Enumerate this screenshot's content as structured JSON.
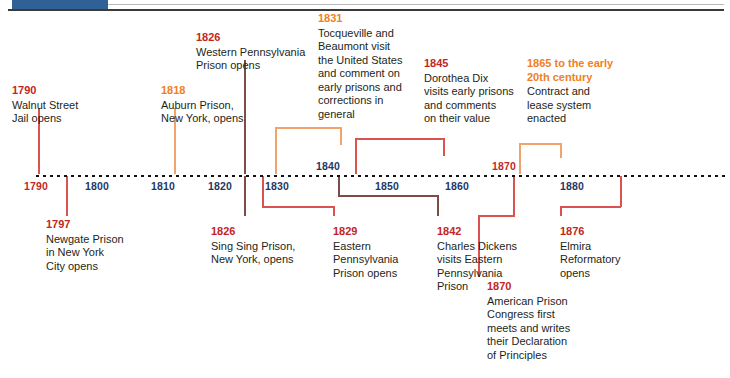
{
  "header": {
    "accent_color": "#2f6096",
    "rule_color": "#3a3a3a"
  },
  "axis": {
    "tick_labels_below": [
      {
        "year": "1790",
        "color": "red"
      },
      {
        "year": "1800",
        "color": "blue"
      },
      {
        "year": "1810",
        "color": "blue"
      },
      {
        "year": "1820",
        "color": "blue"
      },
      {
        "year": "1830",
        "color": "blue"
      },
      {
        "year": "1850",
        "color": "blue"
      },
      {
        "year": "1860",
        "color": "blue"
      },
      {
        "year": "1880",
        "color": "blue"
      }
    ],
    "tick_labels_above": [
      {
        "year": "1840",
        "color": "blue"
      },
      {
        "year": "1870",
        "color": "red"
      }
    ],
    "range_start": 1790,
    "range_end": 1890
  },
  "events_above": [
    {
      "year": "1790",
      "text": "Walnut Street\nJail opens",
      "year_color": "red"
    },
    {
      "year": "1818",
      "text": "Auburn Prison,\nNew York, opens",
      "year_color": "orange"
    },
    {
      "year": "1826",
      "text": "Western Pennsylvania\nPrison opens",
      "year_color": "red"
    },
    {
      "year": "1831",
      "text": "Tocqueville and\nBeaumont visit\nthe United States\nand comment on\nearly prisons and\ncorrections in\ngeneral",
      "year_color": "orange"
    },
    {
      "year": "1845",
      "text": "Dorothea Dix\nvisits early prisons\nand comments\non their value",
      "year_color": "red"
    },
    {
      "year": "1865 to the early\n20th century",
      "text": "Contract and\nlease system\nenacted",
      "year_color": "orange"
    }
  ],
  "events_below": [
    {
      "year": "1797",
      "text": "Newgate Prison\nin New York\nCity opens",
      "year_color": "red"
    },
    {
      "year": "1826",
      "text": "Sing Sing Prison,\nNew York, opens",
      "year_color": "red"
    },
    {
      "year": "1829",
      "text": "Eastern\nPennsylvania\nPrison opens",
      "year_color": "red"
    },
    {
      "year": "1842",
      "text": "Charles Dickens\nvisits Eastern\nPennsylvania\nPrison",
      "year_color": "red"
    },
    {
      "year": "1870",
      "text": "American Prison\nCongress first\nmeets and writes\ntheir Declaration\nof Principles",
      "year_color": "red"
    },
    {
      "year": "1876",
      "text": "Elmira\nReformatory\nopens",
      "year_color": "red"
    }
  ],
  "colors": {
    "blue": "#1f3864",
    "red": "#c3261e",
    "orange": "#ef8023",
    "body": "#231f20",
    "connector_red": "#d9534f",
    "connector_orange": "#f0a36a"
  }
}
